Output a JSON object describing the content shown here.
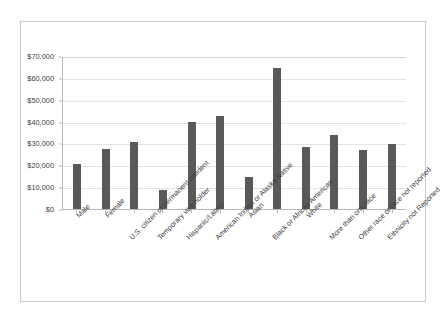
{
  "chart_data": {
    "type": "bar",
    "title": "",
    "subtitle": "",
    "xlabel": "",
    "ylabel": "",
    "ylim": [
      0,
      70000
    ],
    "y_tick_labels": [
      "$0",
      "$10,000",
      "$20,000",
      "$30,000",
      "$40,000",
      "$50,000",
      "$60,000",
      "$70,000"
    ],
    "y_tick_values": [
      0,
      10000,
      20000,
      30000,
      40000,
      50000,
      60000,
      70000
    ],
    "grid": "horizontal",
    "legend": "none",
    "bar_color": "#595959",
    "gridline_color": "#e3e3e3",
    "axis_color": "#b8b8b8",
    "frame_color": "#c9c9c9",
    "categories": [
      "Male",
      "Female",
      "U.S. citizen or permanent resident",
      "Temporary visa holder",
      "Hispanic/Latino",
      "American Indian or Alaska Native",
      "Asian",
      "Black or African American",
      "White",
      "More than one race",
      "Other race or race not reported",
      "Ethnicity not Reported"
    ],
    "values": [
      20500,
      27500,
      30700,
      8900,
      39700,
      42600,
      14800,
      64500,
      28300,
      33700,
      26900,
      29600
    ]
  }
}
